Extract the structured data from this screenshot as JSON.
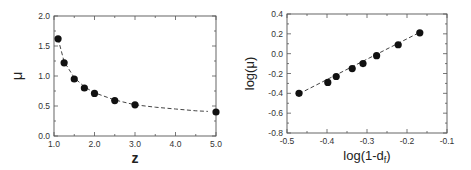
{
  "chart_data": [
    {
      "type": "scatter",
      "title": "",
      "xlabel": "z",
      "ylabel": "μ",
      "xlim": [
        1.0,
        5.0
      ],
      "ylim": [
        0.0,
        2.0
      ],
      "xticks": [
        "1.0",
        "2.0",
        "3.0",
        "4.0",
        "5.0"
      ],
      "yticks": [
        "0.0",
        "0.5",
        "1.0",
        "1.5",
        "2.0"
      ],
      "grid": false,
      "legend": null,
      "series": [
        {
          "name": "data",
          "marker": "filled-circle",
          "x": [
            1.1,
            1.25,
            1.5,
            1.75,
            2.0,
            2.5,
            3.0,
            5.0
          ],
          "y": [
            1.62,
            1.22,
            0.95,
            0.8,
            0.71,
            0.59,
            0.52,
            0.4
          ]
        },
        {
          "name": "fit",
          "style": "dashed",
          "x": [
            1.1,
            1.25,
            1.5,
            1.75,
            2.0,
            2.5,
            3.0,
            3.5,
            4.0,
            4.5,
            4.8
          ],
          "y": [
            1.62,
            1.24,
            0.97,
            0.82,
            0.72,
            0.6,
            0.52,
            0.48,
            0.45,
            0.42,
            0.41
          ]
        }
      ]
    },
    {
      "type": "scatter",
      "title": "",
      "xlabel": "log(1-d",
      "xlabel_sub": "f",
      "xlabel_end": ")",
      "ylabel": "log(μ)",
      "xlim": [
        -0.5,
        -0.1
      ],
      "ylim": [
        -0.8,
        0.4
      ],
      "xticks": [
        "-0.5",
        "-0.4",
        "-0.3",
        "-0.2",
        "-0.1"
      ],
      "yticks": [
        "-0.8",
        "-0.6",
        "-0.4",
        "-0.2",
        "0.0",
        "0.2",
        "0.4"
      ],
      "grid": false,
      "legend": null,
      "series": [
        {
          "name": "data",
          "marker": "filled-circle",
          "x": [
            -0.47,
            -0.398,
            -0.377,
            -0.337,
            -0.31,
            -0.276,
            -0.222,
            -0.168
          ],
          "y": [
            -0.4,
            -0.29,
            -0.23,
            -0.15,
            -0.1,
            -0.02,
            0.09,
            0.21
          ]
        },
        {
          "name": "fit",
          "style": "dashed",
          "x": [
            -0.47,
            -0.168
          ],
          "y": [
            -0.405,
            0.215
          ]
        }
      ]
    }
  ]
}
